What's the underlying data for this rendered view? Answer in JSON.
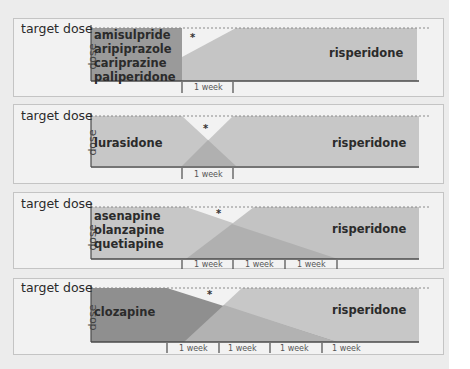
{
  "colors": {
    "background": "#ececec",
    "panel": "#f2f2f2",
    "first_drug": "#9e9e9e",
    "first_drug_dark": "#8a8a8a",
    "risperidone": "#c5c5c5",
    "overlap": "#b2b2b2",
    "axis": "#4a4a4a"
  },
  "common": {
    "target_label": "target dose",
    "y_label": "dose",
    "second_drug": "risperidone",
    "week_label": "1 week",
    "gap_marker": "*"
  },
  "panels": [
    {
      "id": "p1",
      "first_drugs": [
        "amisulpride",
        "aripiprazole",
        "cariprazine",
        "paliperidone"
      ],
      "week_ticks": 1,
      "description": "Abrupt stop of first drug; risperidone titrated up over 1 week"
    },
    {
      "id": "p2",
      "first_drugs": [
        "lurasidone"
      ],
      "week_ticks": 1,
      "description": "Cross-taper over 1 week"
    },
    {
      "id": "p3",
      "first_drugs": [
        "asenapine",
        "olanzapine",
        "quetiapine"
      ],
      "week_ticks": 3,
      "description": "Risperidone up over 1 week, first drug tapered over 3 weeks"
    },
    {
      "id": "p4",
      "first_drugs": [
        "clozapine"
      ],
      "week_ticks": 4,
      "description": "Risperidone up over ~1.5 weeks, clozapine tapered over 4 weeks"
    }
  ]
}
